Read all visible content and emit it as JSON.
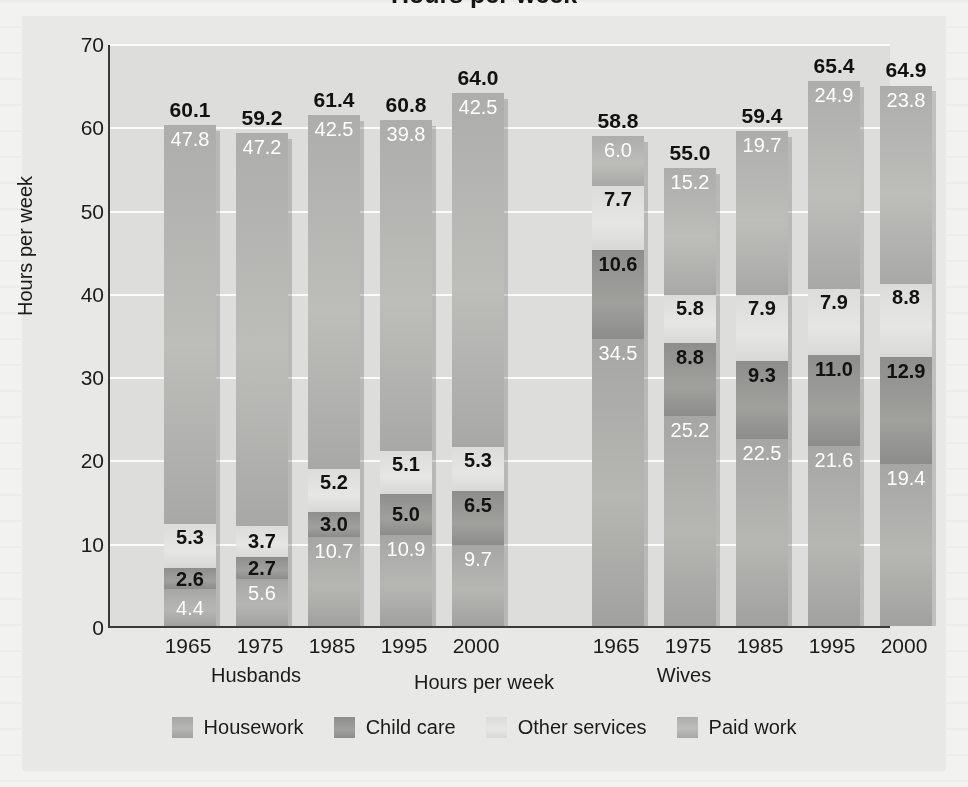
{
  "figure": {
    "cut_title": "Hours per week",
    "ylabel": "Hours per week",
    "xaxis_title": "Hours per week",
    "group_labels": [
      "Husbands",
      "Wives"
    ]
  },
  "chart_data": {
    "type": "bar",
    "subtype": "stacked",
    "title": "Hours per week",
    "xlabel": "Hours per week",
    "ylabel": "Hours per week",
    "ylim": [
      0,
      70
    ],
    "yticks": [
      0,
      10,
      20,
      30,
      40,
      50,
      60,
      70
    ],
    "grid": true,
    "legend_position": "bottom",
    "groups": [
      "Husbands",
      "Wives"
    ],
    "categories": [
      "1965",
      "1975",
      "1985",
      "1995",
      "2000"
    ],
    "series": [
      {
        "name": "Housework",
        "color": "#aaaaa8",
        "stack_order": 1,
        "values_husbands": [
          4.4,
          5.6,
          10.7,
          10.9,
          9.7
        ],
        "values_wives": [
          34.5,
          25.2,
          22.5,
          21.6,
          19.4
        ]
      },
      {
        "name": "Child care",
        "color": "#949492",
        "stack_order": 2,
        "values_husbands": [
          2.6,
          2.7,
          3.0,
          5.0,
          6.5
        ],
        "values_wives": [
          10.6,
          8.8,
          9.3,
          11.0,
          12.9
        ]
      },
      {
        "name": "Other services",
        "color": "#e1e1df",
        "stack_order": 3,
        "values_husbands": [
          5.3,
          3.7,
          5.2,
          5.1,
          5.3
        ],
        "values_wives": [
          7.7,
          5.8,
          7.9,
          7.9,
          8.8
        ]
      },
      {
        "name": "Paid work",
        "color": "#b3b3b0",
        "stack_order": 4,
        "values_husbands": [
          47.8,
          47.2,
          42.5,
          39.8,
          42.5
        ],
        "values_wives": [
          6.0,
          15.2,
          19.7,
          24.9,
          23.8
        ]
      }
    ],
    "totals_husbands": [
      60.1,
      59.2,
      61.4,
      60.8,
      64.0
    ],
    "totals_wives": [
      58.8,
      55.0,
      59.4,
      65.4,
      64.9
    ]
  },
  "bars": [
    {
      "group": "Husbands",
      "year": "1965",
      "total": "60.1",
      "segments": [
        {
          "series": "Housework",
          "label": "4.4",
          "label_style": "light"
        },
        {
          "series": "Child care",
          "label": "2.6",
          "label_style": "dark"
        },
        {
          "series": "Other services",
          "label": "5.3",
          "label_style": "dark"
        },
        {
          "series": "Paid work",
          "label": "47.8",
          "label_style": "light-top"
        }
      ]
    },
    {
      "group": "Husbands",
      "year": "1975",
      "total": "59.2",
      "segments": [
        {
          "series": "Housework",
          "label": "5.6",
          "label_style": "light"
        },
        {
          "series": "Child care",
          "label": "2.7",
          "label_style": "dark"
        },
        {
          "series": "Other services",
          "label": "3.7",
          "label_style": "dark"
        },
        {
          "series": "Paid work",
          "label": "47.2",
          "label_style": "light-top"
        }
      ]
    },
    {
      "group": "Husbands",
      "year": "1985",
      "total": "61.4",
      "segments": [
        {
          "series": "Housework",
          "label": "10.7",
          "label_style": "light"
        },
        {
          "series": "Child care",
          "label": "3.0",
          "label_style": "dark"
        },
        {
          "series": "Other services",
          "label": "5.2",
          "label_style": "dark"
        },
        {
          "series": "Paid work",
          "label": "42.5",
          "label_style": "light-top"
        }
      ]
    },
    {
      "group": "Husbands",
      "year": "1995",
      "total": "60.8",
      "segments": [
        {
          "series": "Housework",
          "label": "10.9",
          "label_style": "light"
        },
        {
          "series": "Child care",
          "label": "5.0",
          "label_style": "dark"
        },
        {
          "series": "Other services",
          "label": "5.1",
          "label_style": "dark"
        },
        {
          "series": "Paid work",
          "label": "39.8",
          "label_style": "light-top"
        }
      ]
    },
    {
      "group": "Husbands",
      "year": "2000",
      "total": "64.0",
      "segments": [
        {
          "series": "Housework",
          "label": "9.7",
          "label_style": "light"
        },
        {
          "series": "Child care",
          "label": "6.5",
          "label_style": "dark"
        },
        {
          "series": "Other services",
          "label": "5.3",
          "label_style": "dark"
        },
        {
          "series": "Paid work",
          "label": "42.5",
          "label_style": "light-top"
        }
      ]
    },
    {
      "group": "Wives",
      "year": "1965",
      "total": "58.8",
      "segments": [
        {
          "series": "Housework",
          "label": "34.5",
          "label_style": "light-top"
        },
        {
          "series": "Child care",
          "label": "10.6",
          "label_style": "dark-top"
        },
        {
          "series": "Other services",
          "label": "7.7",
          "label_style": "dark"
        },
        {
          "series": "Paid work",
          "label": "6.0",
          "label_style": "light-top"
        }
      ]
    },
    {
      "group": "Wives",
      "year": "1975",
      "total": "55.0",
      "segments": [
        {
          "series": "Housework",
          "label": "25.2",
          "label_style": "light-top"
        },
        {
          "series": "Child care",
          "label": "8.8",
          "label_style": "dark-top"
        },
        {
          "series": "Other services",
          "label": "5.8",
          "label_style": "dark"
        },
        {
          "series": "Paid work",
          "label": "15.2",
          "label_style": "light-top"
        }
      ]
    },
    {
      "group": "Wives",
      "year": "1985",
      "total": "59.4",
      "segments": [
        {
          "series": "Housework",
          "label": "22.5",
          "label_style": "light-top"
        },
        {
          "series": "Child care",
          "label": "9.3",
          "label_style": "dark-top"
        },
        {
          "series": "Other services",
          "label": "7.9",
          "label_style": "dark"
        },
        {
          "series": "Paid work",
          "label": "19.7",
          "label_style": "light-top"
        }
      ]
    },
    {
      "group": "Wives",
      "year": "1995",
      "total": "65.4",
      "segments": [
        {
          "series": "Housework",
          "label": "21.6",
          "label_style": "light-top"
        },
        {
          "series": "Child care",
          "label": "11.0",
          "label_style": "dark-top"
        },
        {
          "series": "Other services",
          "label": "7.9",
          "label_style": "dark"
        },
        {
          "series": "Paid work",
          "label": "24.9",
          "label_style": "light-top"
        }
      ]
    },
    {
      "group": "Wives",
      "year": "2000",
      "total": "64.9",
      "segments": [
        {
          "series": "Housework",
          "label": "19.4",
          "label_style": "light-top"
        },
        {
          "series": "Child care",
          "label": "12.9",
          "label_style": "dark-top"
        },
        {
          "series": "Other services",
          "label": "8.8",
          "label_style": "dark"
        },
        {
          "series": "Paid work",
          "label": "23.8",
          "label_style": "light-top"
        }
      ]
    }
  ],
  "legend": {
    "items": [
      {
        "label": "Housework",
        "swatch": "#aaaaa8"
      },
      {
        "label": "Child care",
        "swatch": "#949492"
      },
      {
        "label": "Other services",
        "swatch": "#e1e1df"
      },
      {
        "label": "Paid work",
        "swatch": "#b3b3b0"
      }
    ]
  }
}
